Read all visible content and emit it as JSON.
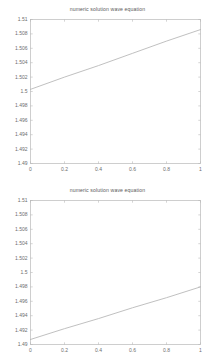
{
  "figure": {
    "background_color": "#ffffff",
    "axis_color": "#b9b9b9",
    "line_color": "#b0b0b0",
    "text_color": "#6e6e6e"
  },
  "chart_data": [
    {
      "type": "line",
      "title": "numeric solution wave equation",
      "xlabel": "",
      "ylabel": "",
      "xlim": [
        0,
        1
      ],
      "ylim": [
        1.49,
        1.51
      ],
      "grid": false,
      "legend": null,
      "xticks": [
        0,
        0.2,
        0.4,
        0.6,
        0.8,
        1
      ],
      "xticklabels": [
        "0",
        "0.2",
        "0.4",
        "0.6",
        "0.8",
        "1"
      ],
      "yticks": [
        1.49,
        1.492,
        1.494,
        1.496,
        1.498,
        1.5,
        1.502,
        1.504,
        1.506,
        1.508,
        1.51
      ],
      "yticklabels": [
        "1.49",
        "1.492",
        "1.494",
        "1.496",
        "1.498",
        "1.5",
        "1.502",
        "1.504",
        "1.506",
        "1.508",
        "1.51"
      ],
      "series": [
        {
          "name": "u(x)",
          "x": [
            0,
            0.2,
            0.4,
            0.6,
            0.8,
            1
          ],
          "values": [
            1.5003,
            1.502,
            1.5036,
            1.5053,
            1.507,
            1.5086
          ]
        }
      ]
    },
    {
      "type": "line",
      "title": "numeric solution wave equation",
      "xlabel": "",
      "ylabel": "",
      "xlim": [
        0,
        1
      ],
      "ylim": [
        1.49,
        1.51
      ],
      "grid": false,
      "legend": null,
      "xticks": [
        0,
        0.2,
        0.4,
        0.6,
        0.8,
        1
      ],
      "xticklabels": [
        "0",
        "0.2",
        "0.4",
        "0.6",
        "0.8",
        "1"
      ],
      "yticks": [
        1.49,
        1.492,
        1.494,
        1.496,
        1.498,
        1.5,
        1.502,
        1.504,
        1.506,
        1.508,
        1.51
      ],
      "yticklabels": [
        "1.49",
        "1.492",
        "1.494",
        "1.496",
        "1.498",
        "1.5",
        "1.502",
        "1.504",
        "1.506",
        "1.508",
        "1.51"
      ],
      "series": [
        {
          "name": "u(x)",
          "x": [
            0,
            0.2,
            0.4,
            0.6,
            0.8,
            1
          ],
          "values": [
            1.4907,
            1.4922,
            1.4936,
            1.4951,
            1.4965,
            1.498
          ]
        }
      ]
    }
  ]
}
